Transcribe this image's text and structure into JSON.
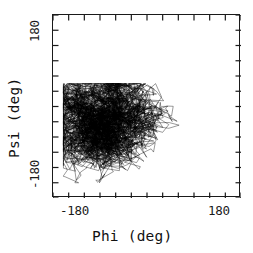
{
  "figure": {
    "background_color": "#ffffff",
    "frame_color": "#1a1a1a",
    "data_color": "#000000"
  },
  "axes": {
    "x_title": "Phi (deg)",
    "y_title": "Psi (deg)",
    "x_tick_min_label": "-180",
    "x_tick_max_label": "180",
    "y_tick_min_label": "-180",
    "y_tick_max_label": "180"
  },
  "chart_data": {
    "type": "line",
    "title": "",
    "subtitle": "",
    "xlabel": "Phi (deg)",
    "ylabel": "Psi (deg)",
    "xlim": [
      -180,
      180
    ],
    "ylim": [
      -180,
      180
    ],
    "xticks": [
      -180,
      -150,
      -120,
      -90,
      -60,
      -30,
      0,
      30,
      60,
      90,
      120,
      150,
      180
    ],
    "yticks": [
      -180,
      -150,
      -120,
      -90,
      -60,
      -30,
      0,
      30,
      60,
      90,
      120,
      150,
      180
    ],
    "xticklabels": [
      "-180",
      "",
      "",
      "",
      "",
      "",
      "",
      "",
      "",
      "",
      "",
      "",
      "180"
    ],
    "yticklabels": [
      "-180",
      "",
      "",
      "",
      "",
      "",
      "",
      "",
      "",
      "",
      "",
      "",
      "180"
    ],
    "grid": false,
    "legend": null,
    "tick_direction": "in",
    "ticks_on_all_sides": true,
    "cluster": {
      "center": [
        -72,
        -35
      ],
      "x_range": [
        -160,
        65
      ],
      "y_range": [
        -150,
        45
      ],
      "peak_density_center": [
        -80,
        -20
      ]
    },
    "series": [
      {
        "name": "phi-psi trajectory",
        "color": "#000000",
        "line_width": 0.4,
        "n_points": 4000,
        "x": [
          -72,
          -68,
          -95,
          -60,
          -110,
          -45,
          -85,
          -120,
          -55,
          -78,
          -100,
          -62,
          -88,
          -135,
          -70,
          -50,
          -92,
          -115,
          -65,
          -80,
          -58,
          -105,
          -75,
          -40,
          -98,
          -125,
          -68,
          -82,
          -52,
          -90
        ],
        "y": [
          -35,
          -20,
          -55,
          -10,
          -70,
          -25,
          -45,
          -90,
          -15,
          -38,
          -60,
          -22,
          -48,
          -100,
          -32,
          -8,
          -52,
          -78,
          -18,
          -42,
          -12,
          -65,
          -36,
          5,
          -58,
          -88,
          -28,
          -44,
          -14,
          -50
        ]
      }
    ]
  }
}
